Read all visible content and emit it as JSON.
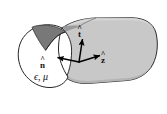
{
  "figure": {
    "background_color": "#ffffff",
    "body_fill_color": "#c8c8c8",
    "face_fill_color": "#ffffff",
    "notch_fill_color": "#787878",
    "outline_color": "#1a1a1a",
    "arrow_color": "#000000"
  },
  "labels": {
    "normal_vector": {
      "letter": "n",
      "hat": "^",
      "full": "n̂",
      "meaning": "unit-normal-vector"
    },
    "tangent_vector": {
      "letter": "t",
      "hat": "^",
      "full": "t̂",
      "meaning": "unit-tangent-vector"
    },
    "axial_vector": {
      "letter": "z",
      "hat": "^",
      "full": "ẑ",
      "meaning": "unit-axial-vector"
    },
    "material": {
      "text": "ϵ, μ",
      "meaning": "permittivity-and-permeability"
    }
  },
  "geometry": {
    "cross_section": "irregular-bean-shape-with-concave-notch",
    "extrusion_direction": "to-the-right",
    "end_cap": "rounded"
  }
}
